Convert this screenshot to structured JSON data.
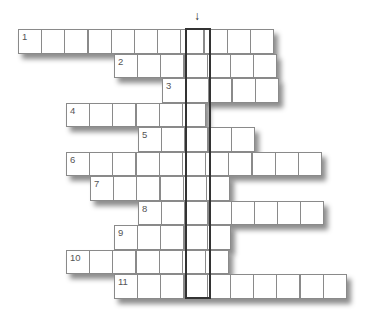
{
  "puzzle": {
    "type": "crossword-keyword",
    "cell_width": 24,
    "cell_height": 24.5,
    "origin_x": 18,
    "origin_y": 29,
    "highlight_column": 7,
    "arrow_glyph": "↓",
    "colors": {
      "grid_line": "#8a8a8a",
      "highlight_border": "#333333",
      "number": "#555555",
      "background": "#ffffff"
    },
    "rows": [
      {
        "number": "1",
        "start_col": 0,
        "length": 11
      },
      {
        "number": "2",
        "start_col": 4,
        "length": 7
      },
      {
        "number": "3",
        "start_col": 6,
        "length": 5
      },
      {
        "number": "4",
        "start_col": 2,
        "length": 6
      },
      {
        "number": "5",
        "start_col": 5,
        "length": 5
      },
      {
        "number": "6",
        "start_col": 2,
        "length": 11
      },
      {
        "number": "7",
        "start_col": 3,
        "length": 6
      },
      {
        "number": "8",
        "start_col": 5,
        "length": 8
      },
      {
        "number": "9",
        "start_col": 4,
        "length": 5
      },
      {
        "number": "10",
        "start_col": 2,
        "length": 7
      },
      {
        "number": "11",
        "start_col": 4,
        "length": 10
      }
    ]
  }
}
